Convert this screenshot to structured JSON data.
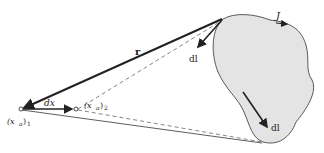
{
  "diagram": {
    "colors": {
      "loop_fill": "#e4e4e4",
      "line": "#222222",
      "dashed": "#666666"
    },
    "labels": {
      "current": "J",
      "r_vector": "r",
      "dl_top": "dl",
      "dl_bottom": "dl",
      "dx": "dx",
      "point1": "(x",
      "point1_sub_a": "a",
      "point1_close": ")",
      "point1_sub": "1",
      "point2": "(x",
      "point2_sub_a": "a",
      "point2_close": ")",
      "point2_sub": "2"
    }
  }
}
